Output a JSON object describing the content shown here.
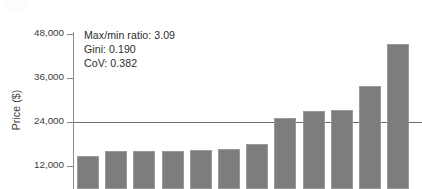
{
  "chart_data": {
    "type": "bar",
    "title": "",
    "subtitle": "",
    "xlabel": "",
    "ylabel": "Price ($)",
    "ylim": [
      0,
      48000
    ],
    "y_ticks": [
      48000,
      36000,
      24000,
      12000
    ],
    "y_tick_labels": [
      "48,000",
      "36,000",
      "24,000",
      "12,000"
    ],
    "grid": false,
    "legend": null,
    "categories": [
      "1",
      "2",
      "3",
      "4",
      "5",
      "6",
      "7",
      "8",
      "9",
      "10",
      "11",
      "12"
    ],
    "values": [
      14700,
      16000,
      16000,
      16000,
      16400,
      16600,
      18000,
      25000,
      27000,
      27300,
      33800,
      45300
    ],
    "series": [
      {
        "name": "Price",
        "values": [
          14700,
          16000,
          16000,
          16000,
          16400,
          16600,
          18000,
          25000,
          27000,
          27300,
          33800,
          45300
        ],
        "color": "#7d7d7d"
      }
    ],
    "reference_lines": [
      {
        "name": "mean-line",
        "value": 24000,
        "orientation": "horizontal",
        "color": "#6e6e6e"
      }
    ],
    "annotations": [
      {
        "name": "max-min-ratio",
        "label": "Max/min ratio: 3.09"
      },
      {
        "name": "gini",
        "label": "Gini: 0.190"
      },
      {
        "name": "cov",
        "label": "CoV: 0.382"
      }
    ]
  },
  "colors": {
    "bar_fill": "#7d7d7d",
    "bar_stroke": "#9a9a9a",
    "axis": "#8a8a8a",
    "reference_line": "#6e6e6e",
    "text": "#2e2e2e",
    "background": "#ffffff"
  }
}
